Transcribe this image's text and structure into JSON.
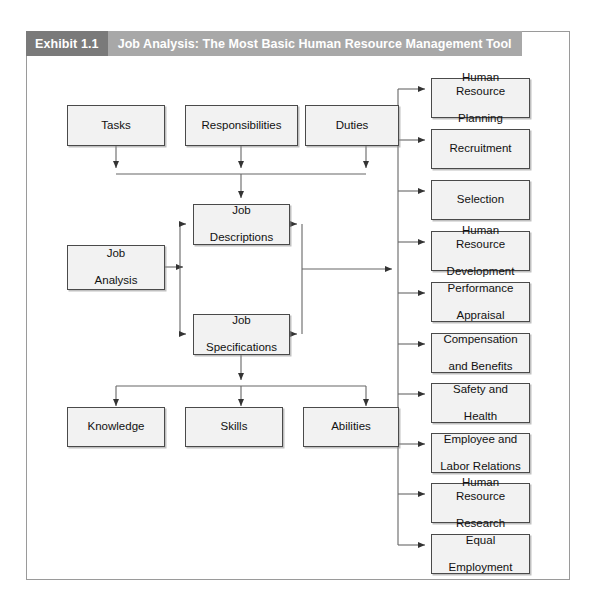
{
  "exhibit": {
    "number": "Exhibit 1.1",
    "title": "Job Analysis: The Most Basic Human Resource Management Tool"
  },
  "diagram": {
    "type": "flowchart",
    "inputs": [
      {
        "id": "tasks",
        "label": "Tasks"
      },
      {
        "id": "responsibilities",
        "label": "Responsibilities"
      },
      {
        "id": "duties",
        "label": "Duties"
      }
    ],
    "core": {
      "id": "job-analysis",
      "label": "Job\nAnalysis",
      "line1": "Job",
      "line2": "Analysis"
    },
    "outputs": [
      {
        "id": "job-descriptions",
        "line1": "Job",
        "line2": "Descriptions"
      },
      {
        "id": "job-specifications",
        "line1": "Job",
        "line2": "Specifications"
      }
    ],
    "ksa": [
      {
        "id": "knowledge",
        "label": "Knowledge"
      },
      {
        "id": "skills",
        "label": "Skills"
      },
      {
        "id": "abilities",
        "label": "Abilities"
      }
    ],
    "hr_functions": [
      {
        "id": "hr-planning",
        "line1": "Human Resource",
        "line2": "Planning"
      },
      {
        "id": "recruitment",
        "line1": "Recruitment",
        "line2": ""
      },
      {
        "id": "selection",
        "line1": "Selection",
        "line2": ""
      },
      {
        "id": "hr-development",
        "line1": "Human Resource",
        "line2": "Development"
      },
      {
        "id": "performance-appraisal",
        "line1": "Performance",
        "line2": "Appraisal"
      },
      {
        "id": "compensation-benefits",
        "line1": "Compensation",
        "line2": "and Benefits"
      },
      {
        "id": "safety-health",
        "line1": "Safety and",
        "line2": "Health"
      },
      {
        "id": "employee-labor-relations",
        "line1": "Employee and",
        "line2": "Labor Relations"
      },
      {
        "id": "hr-research",
        "line1": "Human Resource",
        "line2": "Research"
      },
      {
        "id": "equal-employment",
        "line1": "Equal",
        "line2": "Employment"
      }
    ]
  },
  "colors": {
    "exhibit_number_bg": "#7a7a7a",
    "exhibit_title_bg": "#a8a8a8",
    "node_fill": "#f2f2f2",
    "node_border": "#4a4a4a",
    "frame_border": "#9a9a9a",
    "connector": "#555555"
  }
}
